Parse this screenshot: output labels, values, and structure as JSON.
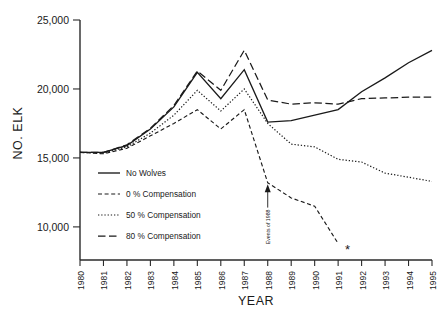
{
  "chart_data": {
    "type": "line",
    "title": "",
    "xlabel": "YEAR",
    "ylabel": "NO. ELK",
    "x": [
      1980,
      1981,
      1982,
      1983,
      1984,
      1985,
      1986,
      1987,
      1988,
      1989,
      1990,
      1991,
      1992,
      1993,
      1994,
      1995
    ],
    "xtick_labels": [
      "1980",
      "1981",
      "1982",
      "1983",
      "1984",
      "1985",
      "1986",
      "1987",
      "1988",
      "1989",
      "1990",
      "1991",
      "1992",
      "1993",
      "1994",
      "1995"
    ],
    "ytick_labels": [
      "25,000",
      "20,000",
      "15,000",
      "10,000"
    ],
    "yticks": [
      25000,
      20000,
      15000,
      10000
    ],
    "xlim": [
      1980,
      1995
    ],
    "ylim": [
      7600,
      25000
    ],
    "grid": false,
    "legend_position": "center-left",
    "series": [
      {
        "name": "No Wolves",
        "dash": "none",
        "values": [
          15400,
          15400,
          15900,
          17100,
          18700,
          21200,
          19300,
          21400,
          17600,
          17700,
          18100,
          18500,
          19800,
          20800,
          21900,
          22800
        ]
      },
      {
        "name": "0 % Compensation",
        "dash": "short-dash",
        "values": [
          15400,
          15300,
          15700,
          16600,
          17500,
          18500,
          17100,
          18500,
          13200,
          12100,
          11500,
          8800,
          null,
          null,
          null,
          null
        ]
      },
      {
        "name": "50 % Compensation",
        "dash": "dotted",
        "values": [
          15400,
          15350,
          15800,
          16800,
          18100,
          19900,
          18400,
          20000,
          17500,
          16000,
          15800,
          14900,
          14700,
          13900,
          13600,
          13300
        ]
      },
      {
        "name": "80 % Compensation",
        "dash": "long-dash",
        "values": [
          15400,
          15400,
          15950,
          17150,
          18800,
          21300,
          19900,
          22800,
          19200,
          18900,
          19000,
          18900,
          19300,
          19350,
          19400,
          19400
        ]
      }
    ],
    "annotations": [
      {
        "name": "events-of-1988-arrow",
        "label": "Events of 1988",
        "x": 1988,
        "y_from": 11400,
        "y_to": 13100
      },
      {
        "name": "asterisk-marker",
        "label": "*",
        "x": 1991.4,
        "y": 8000
      }
    ]
  }
}
